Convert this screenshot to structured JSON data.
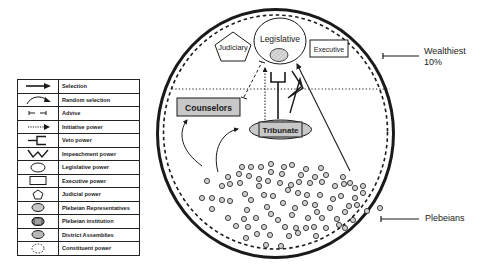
{
  "diagram": {
    "nodes": {
      "legislative": "Legislative",
      "judiciary": "Judiciary",
      "executive": "Executive",
      "counselors": "Counselors",
      "tribunate": "Tribunate"
    },
    "side_labels": {
      "wealthiest_line1": "Wealthiest",
      "wealthiest_line2": "10%",
      "plebeians": "Plebeians"
    },
    "colors": {
      "stroke": "#1a1a1a",
      "fill_gray": "#c8c8c8",
      "background": "#ffffff"
    }
  },
  "legend": {
    "items": [
      {
        "icon": "selection-arrow-icon",
        "label": "Selection"
      },
      {
        "icon": "random-selection-curved-arrow-icon",
        "label": "Random selection"
      },
      {
        "icon": "advise-bracket-icon",
        "label": "Advise"
      },
      {
        "icon": "initiative-dotted-arrow-icon",
        "label": "Initiative power"
      },
      {
        "icon": "veto-fork-icon",
        "label": "Veto power"
      },
      {
        "icon": "impeachment-zigzag-icon",
        "label": "Impeachment power"
      },
      {
        "icon": "legislative-ellipse-icon",
        "label": "Legislative power"
      },
      {
        "icon": "executive-rectangle-icon",
        "label": "Executive power"
      },
      {
        "icon": "judicial-pentagon-icon",
        "label": "Judicial power"
      },
      {
        "icon": "plebeian-representatives-icon",
        "label": "Plebeian Representatives"
      },
      {
        "icon": "plebeian-institution-icon",
        "label": "Plebeian institution"
      },
      {
        "icon": "district-assemblies-icon",
        "label": "District Assemblies"
      },
      {
        "icon": "constituent-power-dashed-circle-icon",
        "label": "Constituent power"
      }
    ]
  }
}
